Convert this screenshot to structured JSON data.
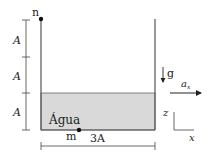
{
  "diagram": {
    "labels": {
      "point_top": "n",
      "point_bottom": "m",
      "height_1": "A",
      "height_2": "A",
      "height_3": "A",
      "width": "3A",
      "fluid": "Água",
      "gravity": "g",
      "acceleration": "a",
      "acceleration_sub": "x",
      "axis_z": "z",
      "axis_x": "x"
    },
    "colors": {
      "water": "#d9d9d9",
      "wall": "#555555",
      "ink": "#222222"
    }
  }
}
